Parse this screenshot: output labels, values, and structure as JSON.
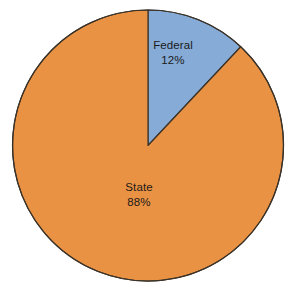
{
  "chart_data": {
    "type": "pie",
    "title": "",
    "subtitle": "",
    "xlabel": "",
    "ylabel": "",
    "grid": false,
    "legend_position": "none",
    "labels_inside_slices": true,
    "start_angle_deg": 0,
    "direction": "clockwise",
    "categories": [
      "Federal",
      "State"
    ],
    "values": [
      12,
      88
    ],
    "value_unit": "%",
    "slices": [
      {
        "label": "Federal",
        "value": 12,
        "display_value": "12%",
        "color": "#86abd6",
        "start_angle_deg": 0,
        "end_angle_deg": 43.2
      },
      {
        "label": "State",
        "value": 88,
        "display_value": "88%",
        "color": "#ea9243",
        "start_angle_deg": 43.2,
        "end_angle_deg": 360
      }
    ]
  },
  "figure": {
    "background": "#ffffff",
    "width": 302,
    "height": 293,
    "center_x": 148,
    "center_y": 145.5,
    "radius": 135.5,
    "stroke_color": "#3a3228",
    "stroke_width": 1.2
  },
  "labels": {
    "federal": {
      "name": "Federal",
      "value": "12%"
    },
    "state": {
      "name": "State",
      "value": "88%"
    }
  }
}
